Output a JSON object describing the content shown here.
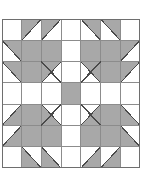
{
  "figure": {
    "type": "quilt-block-diagram",
    "canvas": {
      "width": 146,
      "height": 176,
      "background": "#ffffff"
    },
    "block": {
      "x": 2,
      "y": 19,
      "width": 138,
      "height": 149,
      "rows": 7,
      "cols": 7
    },
    "colors": {
      "patch_gray": "#a8a8a8",
      "patch_white": "#ffffff",
      "grid_line": "#8c8c8c",
      "outline": "#6e6e6e",
      "diagonal_line": "#4a4a4a"
    },
    "legend": {
      "gray_label": "gray patch",
      "white_label": "white patch",
      "triangle_label": "half-square triangle"
    },
    "grid_data": {
      "cell_codes_note": "W=white, G=solid gray, TL/TR/BL/BR = half-square triangle with gray in that corner",
      "rows": [
        [
          "W",
          "TL",
          "TL",
          "W",
          "TR",
          "TR",
          "W"
        ],
        [
          "TR",
          "G",
          "G",
          "W",
          "G",
          "G",
          "TL"
        ],
        [
          "TR",
          "G",
          "TL",
          "W",
          "TR",
          "G",
          "TL"
        ],
        [
          "W",
          "W",
          "W",
          "G",
          "W",
          "W",
          "W"
        ],
        [
          "BR",
          "G",
          "BL",
          "W",
          "BR",
          "G",
          "BL"
        ],
        [
          "BR",
          "G",
          "G",
          "W",
          "G",
          "G",
          "BL"
        ],
        [
          "W",
          "BL",
          "BL",
          "W",
          "BR",
          "BR",
          "W"
        ]
      ]
    },
    "claw_diagonals": [
      {
        "name": "claw-line-top-left",
        "from": "cell-r3c3-outer",
        "to": "center"
      },
      {
        "name": "claw-line-top-right",
        "from": "cell-r3c5-outer",
        "to": "center"
      },
      {
        "name": "claw-line-bottom-left",
        "from": "cell-r5c3-outer",
        "to": "center"
      },
      {
        "name": "claw-line-bottom-right",
        "from": "cell-r5c5-outer",
        "to": "center"
      }
    ]
  }
}
